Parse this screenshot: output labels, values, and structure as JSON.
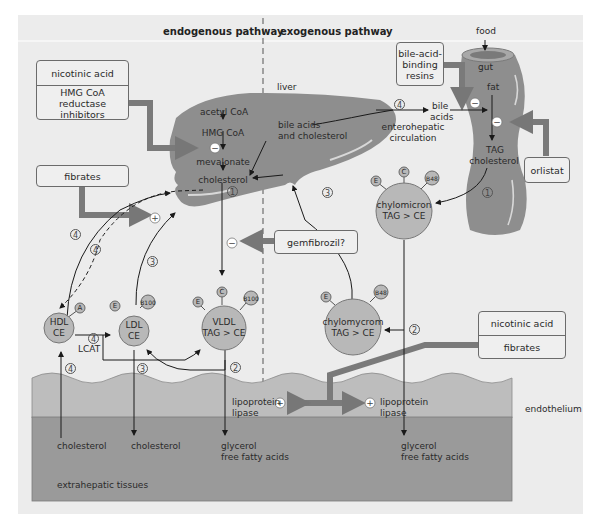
{
  "headers": {
    "endogenous": "endogenous pathway",
    "exogenous": "exogenous pathway"
  },
  "organs": {
    "liver": "liver",
    "gut": "gut",
    "food": "food",
    "endothelium": "endothelium",
    "extrahepatic": "extrahepatic tissues"
  },
  "liver_pathway": {
    "acetyl_coa": "acetyl CoA",
    "hmg_coa": "HMG CoA",
    "mevalonate": "mevalonate",
    "cholesterol": "cholesterol",
    "bile_acids_chol_1": "bile acids",
    "bile_acids_chol_2": "and cholesterol"
  },
  "gut_pathway": {
    "fat": "fat",
    "tag": "TAG",
    "cholesterol": "cholesterol",
    "bile_acids_1": "bile",
    "bile_acids_2": "acids",
    "entero_1": "enterohepatic",
    "entero_2": "circulation"
  },
  "drug_boxes": {
    "box1": {
      "top": "nicotinic acid",
      "bottom_1": "HMG CoA reductase",
      "bottom_2": "inhibitors"
    },
    "fibrates": "fibrates",
    "gemfibrozil": "gemfibrozil?",
    "resins_1": "bile-acid-",
    "resins_2": "binding",
    "resins_3": "resins",
    "orlistat": "orlistat",
    "box2": {
      "top": "nicotinic acid",
      "bottom": "fibrates"
    }
  },
  "lipoproteins": {
    "hdl": {
      "l1": "HDL",
      "l2": "CE",
      "apo": [
        "A"
      ]
    },
    "ldl": {
      "l1": "LDL",
      "l2": "CE",
      "apo": [
        "E",
        "B100"
      ]
    },
    "vldl": {
      "l1": "VLDL",
      "l2": "TAG > CE",
      "apo": [
        "E",
        "C",
        "B100"
      ]
    },
    "chylomicron": {
      "l1": "chylomicron",
      "l2": "TAG > CE",
      "apo": [
        "E",
        "C",
        "B48"
      ]
    },
    "chylomycrom": {
      "l1": "chylomycrom",
      "l2": "TAG > CE",
      "apo": [
        "E",
        "B48"
      ]
    }
  },
  "enzymes": {
    "lcat": "LCAT",
    "lpl_1": "lipoprotein",
    "lpl_2": "lipase"
  },
  "tissue_products": {
    "chol_a": "cholesterol",
    "chol_b": "cholesterol",
    "glyc_a_1": "glycerol",
    "glyc_a_2": "free fatty acids",
    "glyc_b_1": "glycerol",
    "glyc_b_2": "free fatty acids"
  },
  "step_numbers": {
    "one": "1",
    "two": "2",
    "three": "3",
    "four": "4"
  },
  "signs": {
    "minus": "−",
    "plus": "+"
  },
  "colors": {
    "background": "#ececec",
    "organ": "#8e8e8e",
    "lipoprotein": "#b8b8b8",
    "drug_arrow": "#7a7a7a",
    "endothelium": "#bdbdbd",
    "tissue": "#9a9a9a"
  }
}
